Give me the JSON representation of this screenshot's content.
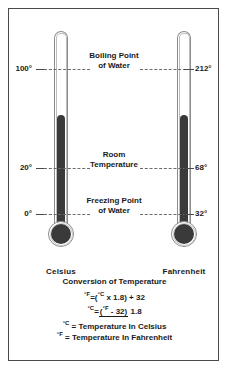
{
  "diagram": {
    "thermometers": [
      {
        "name": "Celsius",
        "side": "left"
      },
      {
        "name": "Fahrenheit",
        "side": "right"
      }
    ],
    "scale_rows": [
      {
        "caption_line1": "Boiling Point",
        "caption_line2": "of Water",
        "celsius": "100°",
        "fahrenheit": "212°"
      },
      {
        "caption_line1": "Room",
        "caption_line2": "Temperature",
        "celsius": "20°",
        "fahrenheit": "68°"
      },
      {
        "caption_line1": "Freezing Point",
        "caption_line2": "of Water",
        "celsius": "0°",
        "fahrenheit": "32°"
      }
    ]
  },
  "conversion": {
    "title": "Conversion of Temperature",
    "formula_f": {
      "left": "°F",
      "equals": "=",
      "right_open": "(",
      "right_c": "°C",
      "right_rest": " x 1.8) + 32"
    },
    "formula_c": {
      "left": "°C",
      "equals": "=",
      "numerator_open": "(",
      "numerator_f": "°F",
      "numerator_rest": " - 32)",
      "denominator": "1.8"
    },
    "legend": [
      {
        "symbol": "°C",
        "text": " = Temperature In Celsius"
      },
      {
        "symbol": "°F",
        "text": " = Temperature In Fahrenheit"
      }
    ]
  },
  "colors": {
    "mercury": "#3a3a3a",
    "glass": "#8c8c8c",
    "border": "#4a4a4a",
    "dash": "#6b6b6b",
    "background": "#ffffff"
  }
}
